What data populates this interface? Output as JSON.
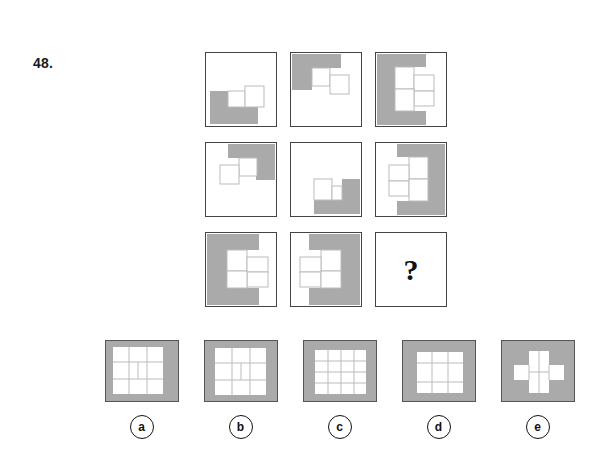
{
  "question": {
    "number": "48.",
    "type": "visual-analogy-matrix",
    "missing_cell_marker": "?"
  },
  "colors": {
    "gray_fill": "#aaaaaa",
    "white_fill": "#ffffff",
    "cell_border": "#444444",
    "thin_line": "#bbbbbb",
    "text": "#111111"
  },
  "matrix": {
    "rows": 3,
    "cols": 3,
    "cells": [
      {
        "id": "r1c1",
        "name": "matrix-cell-r1c1",
        "gray_description": "L-shaped gray block at bottom-left",
        "gray_rects": [
          {
            "x": 4,
            "y": 38,
            "w": 18,
            "h": 33
          },
          {
            "x": 22,
            "y": 54,
            "w": 30,
            "h": 17
          }
        ],
        "outline_squares": [
          {
            "x": 22,
            "y": 38,
            "w": 17,
            "h": 16
          },
          {
            "x": 39,
            "y": 33,
            "w": 19,
            "h": 21
          }
        ]
      },
      {
        "id": "r1c2",
        "name": "matrix-cell-r1c2",
        "gray_description": "Step-shaped gray block at top-left",
        "gray_rects": [
          {
            "x": 1,
            "y": 1,
            "w": 20,
            "h": 36
          },
          {
            "x": 21,
            "y": 1,
            "w": 29,
            "h": 14
          }
        ],
        "outline_squares": [
          {
            "x": 21,
            "y": 15,
            "w": 18,
            "h": 18
          },
          {
            "x": 39,
            "y": 22,
            "w": 19,
            "h": 19
          }
        ]
      },
      {
        "id": "r1c3",
        "name": "matrix-cell-r1c3",
        "gray_description": "C-shaped gray block covering left edge, top-left and bottom-left",
        "gray_rects": [
          {
            "x": 1,
            "y": 1,
            "w": 18,
            "h": 71
          },
          {
            "x": 19,
            "y": 1,
            "w": 31,
            "h": 13
          },
          {
            "x": 19,
            "y": 58,
            "w": 31,
            "h": 14
          }
        ],
        "outline_squares": [
          {
            "x": 19,
            "y": 14,
            "w": 19,
            "h": 22
          },
          {
            "x": 38,
            "y": 22,
            "w": 20,
            "h": 16
          },
          {
            "x": 38,
            "y": 38,
            "w": 20,
            "h": 15
          },
          {
            "x": 19,
            "y": 36,
            "w": 19,
            "h": 22
          }
        ]
      },
      {
        "id": "r2c1",
        "name": "matrix-cell-r2c1",
        "gray_description": "Step-shaped gray block at top-right",
        "gray_rects": [
          {
            "x": 50,
            "y": 1,
            "w": 21,
            "h": 36
          },
          {
            "x": 22,
            "y": 1,
            "w": 28,
            "h": 14
          }
        ],
        "outline_squares": [
          {
            "x": 33,
            "y": 15,
            "w": 18,
            "h": 18
          },
          {
            "x": 14,
            "y": 22,
            "w": 19,
            "h": 19
          }
        ]
      },
      {
        "id": "r2c2",
        "name": "matrix-cell-r2c2",
        "gray_description": "Step-shaped gray block at bottom-right",
        "gray_rects": [
          {
            "x": 51,
            "y": 36,
            "w": 20,
            "h": 35
          },
          {
            "x": 23,
            "y": 57,
            "w": 28,
            "h": 14
          }
        ],
        "outline_squares": [
          {
            "x": 23,
            "y": 36,
            "w": 18,
            "h": 21
          },
          {
            "x": 41,
            "y": 43,
            "w": 10,
            "h": 14
          }
        ]
      },
      {
        "id": "r2c3",
        "name": "matrix-cell-r2c3",
        "gray_description": "C-shaped gray block covering right edge, top-right and bottom-right",
        "gray_rects": [
          {
            "x": 52,
            "y": 1,
            "w": 19,
            "h": 71
          },
          {
            "x": 21,
            "y": 1,
            "w": 31,
            "h": 13
          },
          {
            "x": 21,
            "y": 58,
            "w": 31,
            "h": 14
          }
        ],
        "outline_squares": [
          {
            "x": 33,
            "y": 14,
            "w": 19,
            "h": 22
          },
          {
            "x": 13,
            "y": 22,
            "w": 20,
            "h": 16
          },
          {
            "x": 13,
            "y": 38,
            "w": 20,
            "h": 15
          },
          {
            "x": 33,
            "y": 36,
            "w": 19,
            "h": 22
          }
        ]
      },
      {
        "id": "r3c1",
        "name": "matrix-cell-r3c1",
        "gray_description": "Large C-shaped gray block on left edge",
        "gray_rects": [
          {
            "x": 1,
            "y": 1,
            "w": 20,
            "h": 71
          },
          {
            "x": 21,
            "y": 1,
            "w": 32,
            "h": 16
          },
          {
            "x": 21,
            "y": 55,
            "w": 32,
            "h": 17
          }
        ],
        "outline_squares": [
          {
            "x": 21,
            "y": 17,
            "w": 20,
            "h": 21
          },
          {
            "x": 41,
            "y": 24,
            "w": 21,
            "h": 15
          },
          {
            "x": 41,
            "y": 39,
            "w": 21,
            "h": 15
          },
          {
            "x": 21,
            "y": 38,
            "w": 20,
            "h": 17
          }
        ]
      },
      {
        "id": "r3c2",
        "name": "matrix-cell-r3c2",
        "gray_description": "Large C-shaped gray block on right edge",
        "gray_rects": [
          {
            "x": 50,
            "y": 1,
            "w": 21,
            "h": 71
          },
          {
            "x": 18,
            "y": 1,
            "w": 32,
            "h": 16
          },
          {
            "x": 18,
            "y": 55,
            "w": 32,
            "h": 17
          }
        ],
        "outline_squares": [
          {
            "x": 30,
            "y": 17,
            "w": 20,
            "h": 21
          },
          {
            "x": 9,
            "y": 24,
            "w": 21,
            "h": 15
          },
          {
            "x": 9,
            "y": 39,
            "w": 21,
            "h": 15
          },
          {
            "x": 30,
            "y": 38,
            "w": 20,
            "h": 17
          }
        ]
      },
      {
        "id": "r3c3",
        "name": "matrix-cell-answer-slot",
        "gray_description": "empty cell containing question mark",
        "gray_rects": [],
        "outline_squares": [],
        "is_question": true
      }
    ]
  },
  "options": {
    "items": [
      {
        "id": "a",
        "label": "a",
        "name": "answer-option-a",
        "description": "gray frame with 3x3 white grid, frame thicker on right and bottom",
        "white_rects": [
          {
            "x": 7,
            "y": 6,
            "w": 50,
            "h": 47
          }
        ],
        "grid_lines": [
          {
            "x1": 23,
            "y1": 6,
            "x2": 23,
            "y2": 53
          },
          {
            "x1": 41,
            "y1": 6,
            "x2": 41,
            "y2": 53
          },
          {
            "x1": 7,
            "y1": 21,
            "x2": 57,
            "y2": 21
          },
          {
            "x1": 7,
            "y1": 38,
            "x2": 57,
            "y2": 38
          },
          {
            "x1": 32,
            "y1": 21,
            "x2": 32,
            "y2": 38
          }
        ]
      },
      {
        "id": "b",
        "label": "b",
        "name": "answer-option-b",
        "description": "gray frame with 3x3 white grid centered, inner sub-square divided",
        "white_rects": [
          {
            "x": 10,
            "y": 7,
            "w": 51,
            "h": 47
          }
        ],
        "grid_lines": [
          {
            "x1": 27,
            "y1": 7,
            "x2": 27,
            "y2": 54
          },
          {
            "x1": 45,
            "y1": 7,
            "x2": 45,
            "y2": 54
          },
          {
            "x1": 10,
            "y1": 22,
            "x2": 61,
            "y2": 22
          },
          {
            "x1": 10,
            "y1": 39,
            "x2": 61,
            "y2": 39
          },
          {
            "x1": 36,
            "y1": 22,
            "x2": 36,
            "y2": 39
          }
        ]
      },
      {
        "id": "c",
        "label": "c",
        "name": "answer-option-c",
        "description": "gray frame with 4x4 white grid",
        "white_rects": [
          {
            "x": 11,
            "y": 9,
            "w": 51,
            "h": 44
          }
        ],
        "grid_lines": [
          {
            "x1": 24,
            "y1": 9,
            "x2": 24,
            "y2": 53
          },
          {
            "x1": 37,
            "y1": 9,
            "x2": 37,
            "y2": 53
          },
          {
            "x1": 50,
            "y1": 9,
            "x2": 50,
            "y2": 53
          },
          {
            "x1": 11,
            "y1": 20,
            "x2": 62,
            "y2": 20
          },
          {
            "x1": 11,
            "y1": 31,
            "x2": 62,
            "y2": 31
          },
          {
            "x1": 11,
            "y1": 42,
            "x2": 62,
            "y2": 42
          }
        ]
      },
      {
        "id": "d",
        "label": "d",
        "name": "answer-option-d",
        "description": "thick gray frame with 3x3 white grid",
        "white_rects": [
          {
            "x": 14,
            "y": 11,
            "w": 46,
            "h": 41
          }
        ],
        "grid_lines": [
          {
            "x1": 29,
            "y1": 11,
            "x2": 29,
            "y2": 52
          },
          {
            "x1": 45,
            "y1": 11,
            "x2": 45,
            "y2": 52
          },
          {
            "x1": 14,
            "y1": 22,
            "x2": 60,
            "y2": 22
          },
          {
            "x1": 14,
            "y1": 41,
            "x2": 60,
            "y2": 41
          }
        ]
      },
      {
        "id": "e",
        "label": "e",
        "name": "answer-option-e",
        "description": "gray square with plus/cross shaped white region",
        "white_rects": [
          {
            "x": 27,
            "y": 10,
            "w": 20,
            "h": 42
          },
          {
            "x": 12,
            "y": 24,
            "w": 50,
            "h": 15
          }
        ],
        "grid_lines": [
          {
            "x1": 27,
            "y1": 24,
            "x2": 27,
            "y2": 39
          },
          {
            "x1": 47,
            "y1": 24,
            "x2": 47,
            "y2": 39
          },
          {
            "x1": 27,
            "y1": 31,
            "x2": 47,
            "y2": 31
          },
          {
            "x1": 37,
            "y1": 10,
            "x2": 37,
            "y2": 52
          }
        ]
      }
    ]
  }
}
